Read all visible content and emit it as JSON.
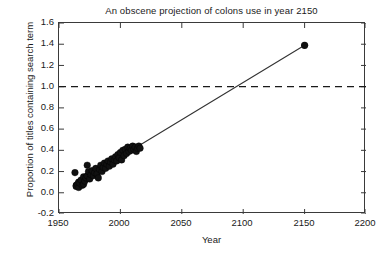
{
  "chart_data": {
    "type": "scatter",
    "title": "An obscene projection of colons use in year 2150",
    "xlabel": "Year",
    "ylabel": "Proportion of titles containing search term",
    "xlim": [
      1950,
      2200
    ],
    "ylim": [
      -0.2,
      1.6
    ],
    "xticks": [
      1950,
      2000,
      2050,
      2100,
      2150,
      2200
    ],
    "yticks": [
      -0.2,
      0.0,
      0.2,
      0.4,
      0.6,
      0.8,
      1.0,
      1.2,
      1.4,
      1.6
    ],
    "xtick_labels": [
      "1950",
      "2000",
      "2050",
      "2100",
      "2150",
      "2200"
    ],
    "ytick_labels": [
      "1.6",
      "1.4",
      "1.2",
      "1.0",
      "0.8",
      "0.6",
      "0.4",
      "0.2",
      "0.0",
      "-0.2"
    ],
    "grid": false,
    "legend": "none",
    "marker_color": "#111111",
    "line_color": "#333333",
    "reference_line_color": "#1a1a1a",
    "series": [
      {
        "name": "Observed proportion of titles containing colon",
        "type": "scatter",
        "marker": "filled-circle",
        "points": [
          [
            1963,
            0.19
          ],
          [
            1964,
            0.07
          ],
          [
            1964,
            0.06
          ],
          [
            1965,
            0.08
          ],
          [
            1966,
            0.05
          ],
          [
            1966,
            0.1
          ],
          [
            1967,
            0.09
          ],
          [
            1968,
            0.12
          ],
          [
            1969,
            0.07
          ],
          [
            1970,
            0.15
          ],
          [
            1970,
            0.08
          ],
          [
            1971,
            0.11
          ],
          [
            1972,
            0.14
          ],
          [
            1973,
            0.26
          ],
          [
            1973,
            0.16
          ],
          [
            1974,
            0.2
          ],
          [
            1975,
            0.13
          ],
          [
            1976,
            0.17
          ],
          [
            1977,
            0.21
          ],
          [
            1978,
            0.16
          ],
          [
            1979,
            0.19
          ],
          [
            1980,
            0.23
          ],
          [
            1981,
            0.18
          ],
          [
            1982,
            0.14
          ],
          [
            1983,
            0.22
          ],
          [
            1984,
            0.26
          ],
          [
            1985,
            0.2
          ],
          [
            1986,
            0.24
          ],
          [
            1987,
            0.28
          ],
          [
            1988,
            0.23
          ],
          [
            1989,
            0.27
          ],
          [
            1990,
            0.3
          ],
          [
            1991,
            0.25
          ],
          [
            1992,
            0.29
          ],
          [
            1993,
            0.32
          ],
          [
            1994,
            0.27
          ],
          [
            1995,
            0.31
          ],
          [
            1996,
            0.34
          ],
          [
            1997,
            0.3
          ],
          [
            1998,
            0.36
          ],
          [
            1999,
            0.33
          ],
          [
            2000,
            0.38
          ],
          [
            2001,
            0.31
          ],
          [
            2002,
            0.4
          ],
          [
            2003,
            0.35
          ],
          [
            2004,
            0.41
          ],
          [
            2005,
            0.37
          ],
          [
            2006,
            0.43
          ],
          [
            2007,
            0.39
          ],
          [
            2008,
            0.42
          ],
          [
            2009,
            0.4
          ],
          [
            2010,
            0.44
          ],
          [
            2011,
            0.41
          ],
          [
            2012,
            0.43
          ],
          [
            2013,
            0.39
          ],
          [
            2014,
            0.42
          ],
          [
            2015,
            0.44
          ],
          [
            2016,
            0.42
          ]
        ]
      },
      {
        "name": "Linear projection to 2150",
        "type": "line",
        "points": [
          [
            2016,
            0.45
          ],
          [
            2150,
            1.39
          ]
        ],
        "endpoint_marker": "filled-circle",
        "endpoint_value": 1.39,
        "endpoint_year": 2150
      },
      {
        "name": "Reference line at proportion 1.0",
        "type": "hline",
        "style": "dashed",
        "y": 1.0
      }
    ],
    "annotations": []
  }
}
